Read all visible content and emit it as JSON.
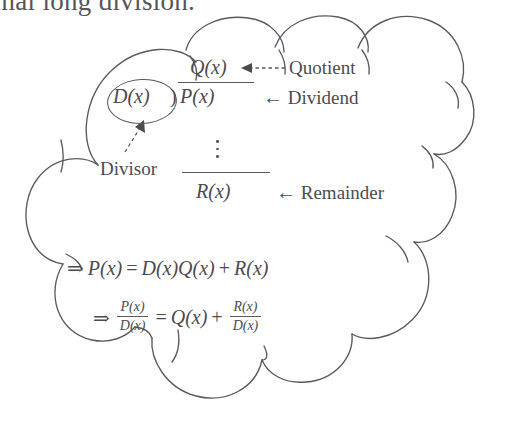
{
  "page": {
    "background_color": "#ffffff",
    "ink_color": "#59595f",
    "top_text": "mal long division."
  },
  "cloud": {
    "shape_name": "thought-cloud",
    "stroke_color": "#59595f"
  },
  "long_division": {
    "quotient": "Q(x)",
    "divisor": "D(x)",
    "divisor_bracket": ")",
    "dividend": "P(x)",
    "vdots": "⋮",
    "remainder": "R(x)",
    "labels": {
      "quotient": "Quotient",
      "dividend": "Dividend",
      "remainder": "Remainder",
      "divisor": "Divisor"
    },
    "arrow_left": "←"
  },
  "equations": {
    "line1": {
      "implies": "⇒",
      "lhs": "P(x)",
      "equals": "=",
      "rhs_a": "D(x)",
      "rhs_b": "Q(x)",
      "plus": "+",
      "rhs_c": "R(x)"
    },
    "line2": {
      "implies": "⇒",
      "lhs_num": "P(x)",
      "lhs_den": "D(x)",
      "equals": "=",
      "rhs_a": "Q(x)",
      "plus": "+",
      "rhs_num": "R(x)",
      "rhs_den": "D(x)"
    }
  }
}
